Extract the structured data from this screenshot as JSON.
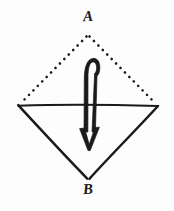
{
  "figure": {
    "type": "geometry-diagram",
    "title": "",
    "background_color": "#fdfdfd",
    "ink_color": "#1a1a1a",
    "width": 174,
    "height": 211,
    "labels": {
      "apex_top": "A",
      "apex_bottom": "B"
    },
    "vertices": {
      "a": {
        "x": 88,
        "y": 34
      },
      "left": {
        "x": 18,
        "y": 105
      },
      "right": {
        "x": 158,
        "y": 106
      },
      "b": {
        "x": 88,
        "y": 179
      }
    },
    "edges": [
      {
        "name": "a-to-left",
        "style": "dotted"
      },
      {
        "name": "a-to-right",
        "style": "dotted"
      },
      {
        "name": "left-to-right",
        "style": "solid"
      },
      {
        "name": "left-to-b",
        "style": "solid"
      },
      {
        "name": "right-to-b",
        "style": "solid"
      }
    ],
    "annotation": {
      "name": "fold-arrow",
      "shape": "hooked-curved-arrow",
      "direction": "down",
      "description": "double-stroke hook arrow curling over the top and pointing downward through the horizontal fold line",
      "tip": {
        "x": 89,
        "y": 150
      }
    }
  }
}
